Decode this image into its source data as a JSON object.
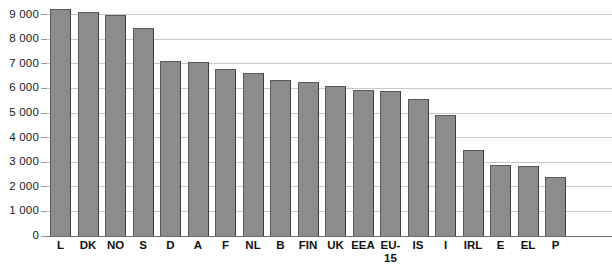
{
  "chart_data": {
    "type": "bar",
    "title": "",
    "subtitle": "",
    "xlabel": "",
    "ylabel": "",
    "ylim": [
      0,
      9500
    ],
    "grid": true,
    "legend": "none",
    "orientation": "vertical",
    "bar_color": "#8c8c8c",
    "categories": [
      "L",
      "DK",
      "NO",
      "S",
      "D",
      "A",
      "F",
      "NL",
      "B",
      "FIN",
      "UK",
      "EEA",
      "EU-15",
      "IS",
      "I",
      "IRL",
      "E",
      "EL",
      "P"
    ],
    "values": [
      9250,
      9120,
      8980,
      8440,
      7100,
      7080,
      6780,
      6620,
      6330,
      6250,
      6100,
      5930,
      5900,
      5560,
      4930,
      3480,
      2880,
      2850,
      2380
    ],
    "ytick_values": [
      0,
      1000,
      2000,
      3000,
      4000,
      5000,
      6000,
      7000,
      8000,
      9000
    ],
    "ytick_labels": [
      "0",
      "1 000",
      "2 000",
      "3 000",
      "4 000",
      "5 000",
      "6 000",
      "7 000",
      "8 000",
      "9 000"
    ]
  },
  "axes": {
    "y_axis_name": "y-axis",
    "x_axis_name": "x-axis"
  }
}
